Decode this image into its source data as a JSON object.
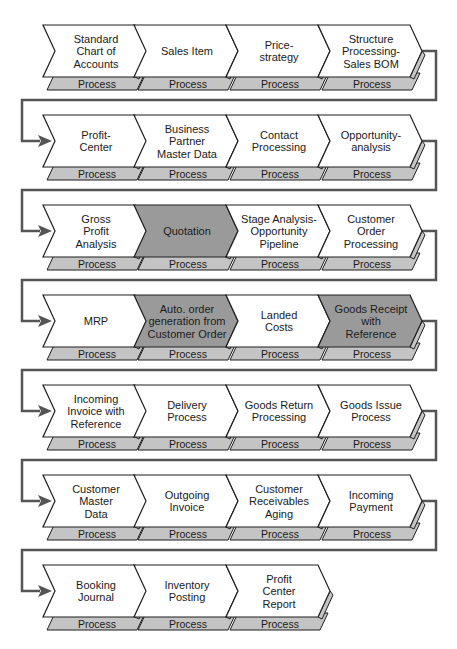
{
  "diagram": {
    "type": "process-chain",
    "colors": {
      "chevron_default": "#ffffff",
      "chevron_highlight": "#9a9a9a",
      "process_band": "#c4c4c4",
      "stroke": "#1f1f1f",
      "connector": "#555555"
    },
    "process_label": "Process",
    "rows": [
      {
        "steps": [
          {
            "lines": [
              "Standard",
              "Chart of",
              "Accounts"
            ],
            "highlight": false
          },
          {
            "lines": [
              "Sales Item"
            ],
            "highlight": false
          },
          {
            "lines": [
              "Price-",
              "strategy"
            ],
            "highlight": false
          },
          {
            "lines": [
              "Structure",
              "Processing-",
              "Sales BOM"
            ],
            "highlight": false
          }
        ]
      },
      {
        "steps": [
          {
            "lines": [
              "Profit-",
              "Center"
            ],
            "highlight": false
          },
          {
            "lines": [
              "Business",
              "Partner",
              "Master Data"
            ],
            "highlight": false
          },
          {
            "lines": [
              "Contact",
              "Processing"
            ],
            "highlight": false
          },
          {
            "lines": [
              "Opportunity-",
              "analysis"
            ],
            "highlight": false
          }
        ]
      },
      {
        "steps": [
          {
            "lines": [
              "Gross",
              "Profit",
              "Analysis"
            ],
            "highlight": false
          },
          {
            "lines": [
              "Quotation"
            ],
            "highlight": true
          },
          {
            "lines": [
              "Stage Analysis-",
              "Opportunity",
              "Pipeline"
            ],
            "highlight": false
          },
          {
            "lines": [
              "Customer",
              "Order",
              "Processing"
            ],
            "highlight": false
          }
        ]
      },
      {
        "steps": [
          {
            "lines": [
              "MRP"
            ],
            "highlight": false
          },
          {
            "lines": [
              "Auto. order",
              "generation from",
              "Customer Order"
            ],
            "highlight": true
          },
          {
            "lines": [
              "Landed",
              "Costs"
            ],
            "highlight": false
          },
          {
            "lines": [
              "Goods Receipt",
              "with",
              "Reference"
            ],
            "highlight": true
          }
        ]
      },
      {
        "steps": [
          {
            "lines": [
              "Incoming",
              "Invoice with",
              "Reference"
            ],
            "highlight": false
          },
          {
            "lines": [
              "Delivery",
              "Process"
            ],
            "highlight": false
          },
          {
            "lines": [
              "Goods Return",
              "Processing"
            ],
            "highlight": false
          },
          {
            "lines": [
              "Goods Issue",
              "Process"
            ],
            "highlight": false
          }
        ]
      },
      {
        "steps": [
          {
            "lines": [
              "Customer",
              "Master",
              "Data"
            ],
            "highlight": false
          },
          {
            "lines": [
              "Outgoing",
              "Invoice"
            ],
            "highlight": false
          },
          {
            "lines": [
              "Customer",
              "Receivables",
              "Aging"
            ],
            "highlight": false
          },
          {
            "lines": [
              "Incoming",
              "Payment"
            ],
            "highlight": false
          }
        ]
      },
      {
        "steps": [
          {
            "lines": [
              "Booking",
              "Journal"
            ],
            "highlight": false
          },
          {
            "lines": [
              "Inventory",
              "Posting"
            ],
            "highlight": false
          },
          {
            "lines": [
              "Profit",
              "Center",
              "Report"
            ],
            "highlight": false
          }
        ]
      }
    ]
  }
}
